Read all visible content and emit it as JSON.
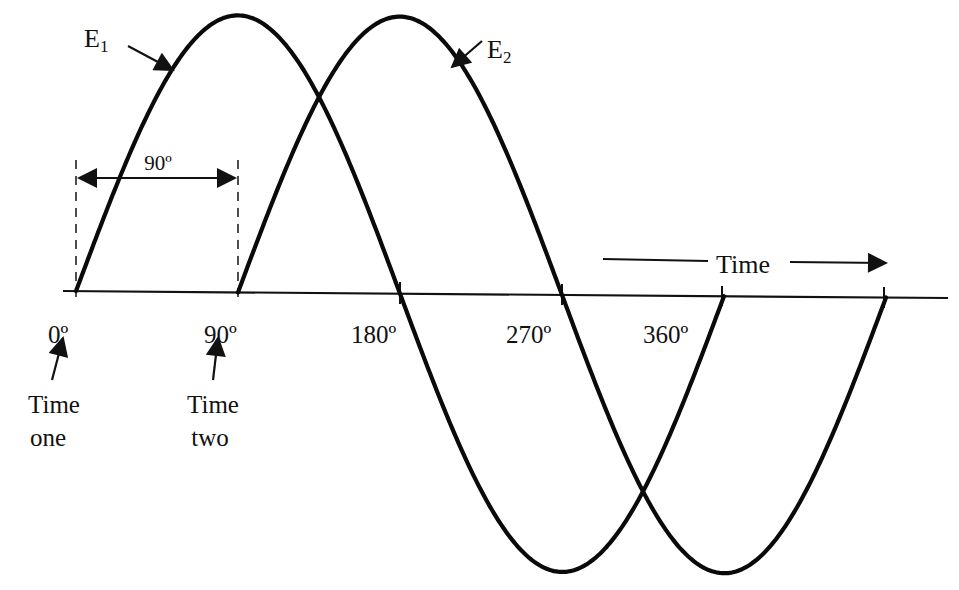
{
  "colors": {
    "ink": "#0a0a0a",
    "background": "#ffffff"
  },
  "geometry": {
    "axis": {
      "x1": 63,
      "y1": 291,
      "x2": 948,
      "y2": 298
    },
    "px_per_90deg": 162,
    "amplitude_px": 277
  },
  "waves": [
    {
      "name": "E1",
      "label_main": "E",
      "label_sub": "1",
      "start_x": 76,
      "phase_deg": 0
    },
    {
      "name": "E2",
      "label_main": "E",
      "label_sub": "2",
      "start_x": 238,
      "phase_deg": 90
    }
  ],
  "phase_marker": {
    "label": "90º"
  },
  "degree_labels": [
    {
      "text": "0º",
      "x": 48,
      "y": 343
    },
    {
      "text": "90º",
      "x": 204,
      "y": 343
    },
    {
      "text": "180º",
      "x": 351,
      "y": 343
    },
    {
      "text": "270º",
      "x": 506,
      "y": 343
    },
    {
      "text": "360º",
      "x": 643,
      "y": 343
    }
  ],
  "callouts": {
    "time_one": {
      "line1": "Time",
      "line2": "one"
    },
    "time_two": {
      "line1": "Time",
      "line2": "two"
    }
  },
  "time_arrow": {
    "label": "Time"
  }
}
